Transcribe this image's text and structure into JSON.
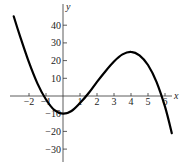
{
  "chart_data": {
    "type": "line",
    "title": "",
    "xlabel": "x",
    "ylabel": "y",
    "xlim": [
      -3.3,
      6.8
    ],
    "ylim": [
      -38,
      50
    ],
    "grid": false,
    "legend": null,
    "x_ticks": [
      -2,
      -1,
      1,
      2,
      3,
      4,
      5,
      6
    ],
    "x_tick_labels": [
      "−2",
      "−1",
      "1",
      "2",
      "3",
      "4",
      "5",
      "6"
    ],
    "y_ticks": [
      40,
      30,
      20,
      10,
      -10,
      -20,
      -30
    ],
    "y_tick_labels": [
      "40",
      "30",
      "20",
      "10",
      "−10",
      "−20",
      "−30"
    ],
    "series": [
      {
        "name": "curve",
        "color": "#000000",
        "x": [
          -2.9,
          -2.5,
          -2,
          -1.5,
          -1,
          -0.5,
          0,
          0.5,
          1,
          1.5,
          2,
          2.5,
          3,
          3.5,
          4,
          4.5,
          5,
          5.5,
          6,
          6.4
        ],
        "y": [
          45,
          33,
          19,
          7,
          -2,
          -8,
          -10,
          -8.5,
          -4,
          1.5,
          8,
          14,
          19.5,
          23.5,
          25,
          23,
          17.5,
          8,
          -6,
          -21
        ]
      }
    ]
  }
}
